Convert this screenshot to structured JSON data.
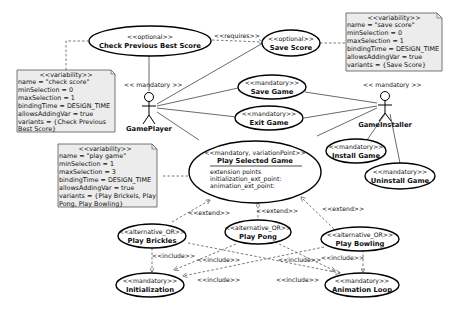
{
  "diagram": {
    "type": "UML use case diagram",
    "actors": [
      {
        "id": "gameplayer",
        "name": "GamePlayer",
        "stereotype": "<< mandatory >>"
      },
      {
        "id": "gameinstaller",
        "name": "GameInstaller",
        "stereotype": "<< mandatory >>"
      }
    ],
    "use_cases": {
      "check_previous_best_score": {
        "stereotype": "<<optional>>",
        "name": "Check Previous Best Score"
      },
      "save_score": {
        "stereotype": "<<optional>>",
        "name": "Save Score"
      },
      "save_game": {
        "stereotype": "<<mandatory>>",
        "name": "Save Game"
      },
      "exit_game": {
        "stereotype": "<<mandatory>>",
        "name": "Exit Game"
      },
      "install_game": {
        "stereotype": "<<mandatory>>",
        "name": "Install Game"
      },
      "uninstall_game": {
        "stereotype": "<<mandatory>>",
        "name": "Uninstall Game"
      },
      "play_selected_game": {
        "stereotype": "<<mandatory, variationPoint>>",
        "name": "Play Selected Game",
        "extension_points": [
          "extension points",
          "initialization_ext_point:",
          "animation_ext_point:"
        ]
      },
      "play_brickles": {
        "stereotype": "<<alternative_OR>>",
        "name": "Play Brickles"
      },
      "play_pong": {
        "stereotype": "<<alternative_OR>>",
        "name": "Play Pong"
      },
      "play_bowling": {
        "stereotype": "<<alternative_OR>>",
        "name": "Play Bowling"
      },
      "initialization": {
        "stereotype": "<<mandatory>>",
        "name": "Initialization"
      },
      "animation_loop": {
        "stereotype": "<<mandatory>>",
        "name": "Animation Loop"
      }
    },
    "notes": {
      "check_score": {
        "lines": [
          "<<variability>>",
          "name = \"check score\"",
          "minSelection = 0",
          "maxSelection = 1",
          "bindingTime = DESIGN_TIME",
          "allowsAddingVar = true",
          "variants = {Check Previous",
          "Best Score}"
        ]
      },
      "save_score": {
        "lines": [
          "<<variability>>",
          "name = \"save score\"",
          "minSelection = 0",
          "maxSelection = 1",
          "bindingTime = DESIGN_TIME",
          "allowsAddingVar = true",
          "variants = {Save Score}"
        ]
      },
      "play_game": {
        "lines": [
          "<<variability>>",
          "name = \"play game\"",
          "minSelection = 1",
          "maxSelection = 3",
          "bindingTime = DESIGN_TIME",
          "allowsAddingVar = true",
          "variants = {Play Brickels, Play",
          "Pong, Play Bowling}"
        ]
      }
    },
    "edge_labels": {
      "requires": "<<requires>>",
      "extend": "<<extend>>",
      "include": "<<include>>"
    }
  }
}
